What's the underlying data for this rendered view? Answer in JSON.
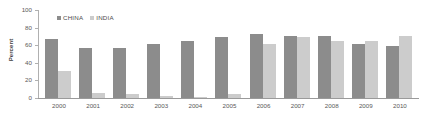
{
  "chart_data": {
    "type": "bar",
    "title": "",
    "xlabel": "",
    "ylabel": "Percent",
    "ylim": [
      0,
      100
    ],
    "yticks": [
      0,
      20,
      40,
      60,
      80,
      100
    ],
    "grid": false,
    "legend_position": "top-left",
    "categories": [
      "2000",
      "2001",
      "2002",
      "2003",
      "2004",
      "2005",
      "2006",
      "2007",
      "2008",
      "2009",
      "2010"
    ],
    "series": [
      {
        "name": "CHINA",
        "color": "#8c8c8c",
        "values": [
          67,
          57,
          57,
          61,
          65,
          69,
          73,
          71,
          70,
          61,
          59
        ]
      },
      {
        "name": "INDIA",
        "color": "#cccccc",
        "values": [
          31,
          6,
          4,
          2,
          1,
          4,
          61,
          69,
          65,
          65,
          70
        ]
      }
    ]
  },
  "axis": {
    "y_title": "Percent"
  }
}
